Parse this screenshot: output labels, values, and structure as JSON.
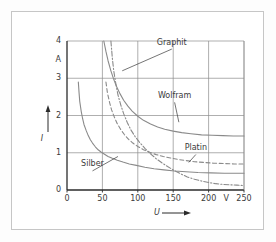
{
  "figure": {
    "background": "#fdfdfd",
    "frame_color": "#c6c6c6",
    "grid_color": "#8c8c8c",
    "axis_color": "#2b2b2b",
    "curve_color": "#8a8a8a",
    "text_color": "#3a3a3a"
  },
  "chart_data": {
    "type": "line",
    "title": "",
    "subtitle": "",
    "xlabel": "U",
    "ylabel": "I",
    "xunit": "V",
    "yunit": "A",
    "xlim": [
      0,
      250
    ],
    "ylim": [
      0,
      4
    ],
    "xticks": [
      0,
      50,
      100,
      150,
      200,
      250
    ],
    "xtick_labels": [
      "0",
      "50",
      "100",
      "150",
      "200",
      "250"
    ],
    "yticks": [
      0,
      1,
      2,
      3,
      4
    ],
    "ytick_labels": [
      "0",
      "1",
      "2",
      "3",
      "4"
    ],
    "grid": true,
    "legend": "inline-annotations",
    "series": [
      {
        "name": "Graphit",
        "style": "dash-dot",
        "label_x": 148,
        "label_y": 3.85,
        "leader_to_x": 78,
        "leader_to_y": 3.2,
        "points": [
          [
            62,
            4.0
          ],
          [
            64,
            3.55
          ],
          [
            66,
            3.2
          ],
          [
            69,
            2.85
          ],
          [
            72,
            2.55
          ],
          [
            76,
            2.28
          ],
          [
            80,
            2.05
          ],
          [
            85,
            1.82
          ],
          [
            90,
            1.62
          ],
          [
            96,
            1.44
          ],
          [
            102,
            1.29
          ],
          [
            110,
            1.12
          ],
          [
            118,
            0.97
          ],
          [
            126,
            0.84
          ],
          [
            134,
            0.73
          ],
          [
            142,
            0.63
          ],
          [
            150,
            0.54
          ],
          [
            160,
            0.44
          ],
          [
            170,
            0.35
          ],
          [
            180,
            0.29
          ],
          [
            190,
            0.24
          ],
          [
            200,
            0.2
          ],
          [
            210,
            0.17
          ],
          [
            220,
            0.15
          ],
          [
            230,
            0.14
          ],
          [
            240,
            0.13
          ],
          [
            250,
            0.12
          ]
        ]
      },
      {
        "name": "Wolfram",
        "style": "solid",
        "label_x": 152,
        "label_y": 2.42,
        "leader_to_x": 158,
        "leader_to_y": 1.82,
        "points": [
          [
            52,
            4.0
          ],
          [
            55,
            3.72
          ],
          [
            58,
            3.47
          ],
          [
            62,
            3.2
          ],
          [
            66,
            2.97
          ],
          [
            70,
            2.78
          ],
          [
            75,
            2.58
          ],
          [
            80,
            2.41
          ],
          [
            86,
            2.25
          ],
          [
            92,
            2.12
          ],
          [
            100,
            1.98
          ],
          [
            108,
            1.87
          ],
          [
            118,
            1.77
          ],
          [
            128,
            1.69
          ],
          [
            138,
            1.63
          ],
          [
            150,
            1.58
          ],
          [
            162,
            1.54
          ],
          [
            175,
            1.51
          ],
          [
            190,
            1.48
          ],
          [
            205,
            1.47
          ],
          [
            220,
            1.46
          ],
          [
            235,
            1.45
          ],
          [
            250,
            1.45
          ]
        ]
      },
      {
        "name": "Platin",
        "style": "dashed",
        "label_x": 182,
        "label_y": 1.02,
        "leader_to_x": 172,
        "leader_to_y": 0.74,
        "points": [
          [
            55,
            2.9
          ],
          [
            57,
            2.62
          ],
          [
            60,
            2.36
          ],
          [
            63,
            2.15
          ],
          [
            67,
            1.95
          ],
          [
            71,
            1.78
          ],
          [
            76,
            1.62
          ],
          [
            81,
            1.49
          ],
          [
            87,
            1.36
          ],
          [
            93,
            1.26
          ],
          [
            100,
            1.17
          ],
          [
            108,
            1.08
          ],
          [
            117,
            1.01
          ],
          [
            126,
            0.95
          ],
          [
            136,
            0.9
          ],
          [
            146,
            0.86
          ],
          [
            157,
            0.82
          ],
          [
            168,
            0.79
          ],
          [
            180,
            0.76
          ],
          [
            193,
            0.74
          ],
          [
            207,
            0.72
          ],
          [
            222,
            0.71
          ],
          [
            236,
            0.7
          ],
          [
            250,
            0.7
          ]
        ]
      },
      {
        "name": "Silber",
        "style": "solid",
        "label_x": 36,
        "label_y": 0.58,
        "leader_to_x": 72,
        "leader_to_y": 0.9,
        "points": [
          [
            16,
            2.9
          ],
          [
            17,
            2.62
          ],
          [
            18,
            2.38
          ],
          [
            20,
            2.12
          ],
          [
            22,
            1.92
          ],
          [
            24,
            1.76
          ],
          [
            27,
            1.6
          ],
          [
            30,
            1.46
          ],
          [
            33,
            1.35
          ],
          [
            36,
            1.26
          ],
          [
            40,
            1.16
          ],
          [
            44,
            1.08
          ],
          [
            48,
            1.02
          ],
          [
            53,
            0.96
          ],
          [
            58,
            0.9
          ],
          [
            64,
            0.85
          ],
          [
            71,
            0.8
          ],
          [
            79,
            0.75
          ],
          [
            88,
            0.7
          ],
          [
            98,
            0.66
          ],
          [
            110,
            0.61
          ],
          [
            123,
            0.57
          ],
          [
            137,
            0.54
          ],
          [
            152,
            0.51
          ],
          [
            168,
            0.49
          ],
          [
            185,
            0.47
          ],
          [
            203,
            0.46
          ],
          [
            222,
            0.45
          ],
          [
            250,
            0.45
          ]
        ]
      }
    ]
  },
  "axes": {
    "y_unit_label": "A",
    "x_unit_label": "V",
    "y_axis_symbol": "I",
    "x_axis_symbol": "U"
  }
}
